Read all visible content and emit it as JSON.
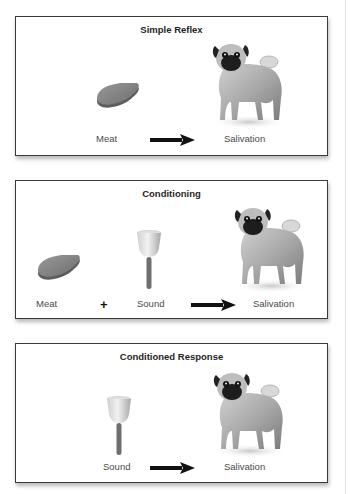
{
  "diagram": {
    "panels": [
      {
        "title": "Simple Reflex",
        "items": [
          {
            "icon": "meat-icon",
            "label": "Meat"
          },
          {
            "connector": "arrow-right-icon"
          },
          {
            "icon": "dog-icon",
            "label": "Salivation"
          }
        ],
        "labels": {
          "stimulus": "Meat",
          "response": "Salivation"
        }
      },
      {
        "title": "Conditioning",
        "items": [
          {
            "icon": "meat-icon",
            "label": "Meat"
          },
          {
            "connector": "plus-icon",
            "symbol": "+"
          },
          {
            "icon": "bell-icon",
            "label": "Sound"
          },
          {
            "connector": "arrow-right-icon"
          },
          {
            "icon": "dog-icon",
            "label": "Salivation"
          }
        ],
        "labels": {
          "stimulus1": "Meat",
          "plus": "+",
          "stimulus2": "Sound",
          "response": "Salivation"
        }
      },
      {
        "title": "Conditioned Response",
        "items": [
          {
            "icon": "bell-icon",
            "label": "Sound"
          },
          {
            "connector": "arrow-right-icon"
          },
          {
            "icon": "dog-icon",
            "label": "Salivation"
          }
        ],
        "labels": {
          "stimulus": "Sound",
          "response": "Salivation"
        }
      }
    ],
    "colors": {
      "border": "#3a3a3a",
      "text": "#4a4a4a",
      "title": "#1f1f1f",
      "arrow": "#111111"
    }
  }
}
